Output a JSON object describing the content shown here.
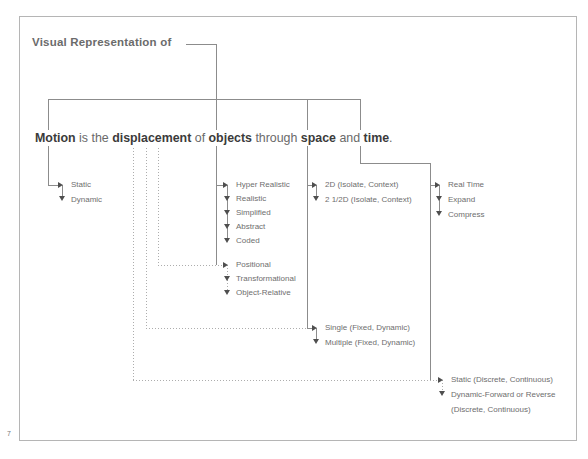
{
  "page": {
    "number": "7"
  },
  "title": {
    "text": "Visual Representation of"
  },
  "sentence": {
    "motion": "Motion",
    "is_the": " is the ",
    "displacement": "displacement",
    "of": " of ",
    "objects": "objects",
    "through": " through ",
    "space": "space",
    "and": " and ",
    "time": "time",
    "period": "."
  },
  "colors": {
    "frame": "#b5b5b5",
    "solid_line": "#8c8c8c",
    "dotted_line": "#adadad",
    "label_text": "#6e6e6e",
    "sentence_text": "#6a6a6a",
    "sentence_bold": "#3b3b3b"
  },
  "branches": {
    "motion": {
      "items": [
        "Static",
        "Dynamic"
      ]
    },
    "representation": {
      "items": [
        "Hyper Realistic",
        "Realistic",
        "Simplified",
        "Abstract",
        "Coded"
      ]
    },
    "displacement_type": {
      "items": [
        "Positional",
        "Transformational",
        "Object-Relative"
      ]
    },
    "dimension": {
      "items": [
        "2D (Isolate, Context)",
        "2 1/2D (Isolate, Context)"
      ]
    },
    "object_count": {
      "items": [
        "Single (Fixed, Dynamic)",
        "Multiple (Fixed, Dynamic)"
      ]
    },
    "time_mode": {
      "items": [
        "Real Time",
        "Expand",
        "Compress"
      ]
    },
    "playback": {
      "items": [
        "Static (Discrete, Continuous)",
        "Dynamic-Forward or Reverse",
        "(Discrete, Continuous)"
      ]
    }
  }
}
